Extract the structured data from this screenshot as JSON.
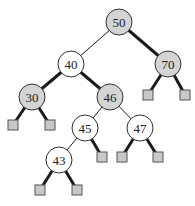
{
  "diagram": {
    "type": "red-black-tree",
    "colors": {
      "shaded_node": "#d4d4d4",
      "white_node": "#ffffff",
      "leaf": "#c8c8c8",
      "stroke": "#1a1a1a"
    },
    "nodes": [
      {
        "id": "n50",
        "label": "50",
        "x": 119,
        "y": 22,
        "shaded": true
      },
      {
        "id": "n40",
        "label": "40",
        "x": 71,
        "y": 64,
        "shaded": false
      },
      {
        "id": "n70",
        "label": "70",
        "x": 168,
        "y": 64,
        "shaded": true
      },
      {
        "id": "n30",
        "label": "30",
        "x": 32,
        "y": 97,
        "shaded": true
      },
      {
        "id": "n46",
        "label": "46",
        "x": 110,
        "y": 97,
        "shaded": true
      },
      {
        "id": "n45",
        "label": "45",
        "x": 85,
        "y": 128,
        "shaded": false
      },
      {
        "id": "n47",
        "label": "47",
        "x": 140,
        "y": 128,
        "shaded": false
      },
      {
        "id": "n43",
        "label": "43",
        "x": 59,
        "y": 160,
        "shaded": false
      }
    ],
    "leaves": [
      {
        "id": "l70a",
        "x": 148,
        "y": 95
      },
      {
        "id": "l70b",
        "x": 185,
        "y": 95
      },
      {
        "id": "l30a",
        "x": 13,
        "y": 125
      },
      {
        "id": "l30b",
        "x": 50,
        "y": 125
      },
      {
        "id": "l45b",
        "x": 102,
        "y": 157
      },
      {
        "id": "l47a",
        "x": 122,
        "y": 157
      },
      {
        "id": "l47b",
        "x": 158,
        "y": 157
      },
      {
        "id": "l43a",
        "x": 40,
        "y": 190
      },
      {
        "id": "l43b",
        "x": 77,
        "y": 190
      }
    ],
    "edges": [
      {
        "from": "n50",
        "to": "n40",
        "thick": false
      },
      {
        "from": "n50",
        "to": "n70",
        "thick": true
      },
      {
        "from": "n40",
        "to": "n30",
        "thick": true
      },
      {
        "from": "n40",
        "to": "n46",
        "thick": true
      },
      {
        "from": "n70",
        "to": "l70a",
        "thick": true
      },
      {
        "from": "n70",
        "to": "l70b",
        "thick": true
      },
      {
        "from": "n30",
        "to": "l30a",
        "thick": true
      },
      {
        "from": "n30",
        "to": "l30b",
        "thick": true
      },
      {
        "from": "n46",
        "to": "n45",
        "thick": false
      },
      {
        "from": "n46",
        "to": "n47",
        "thick": false
      },
      {
        "from": "n45",
        "to": "n43",
        "thick": false
      },
      {
        "from": "n45",
        "to": "l45b",
        "thick": true
      },
      {
        "from": "n47",
        "to": "l47a",
        "thick": true
      },
      {
        "from": "n47",
        "to": "l47b",
        "thick": true
      },
      {
        "from": "n43",
        "to": "l43a",
        "thick": true
      },
      {
        "from": "n43",
        "to": "l43b",
        "thick": true
      }
    ],
    "node_radius": 13,
    "leaf_size": 10
  }
}
